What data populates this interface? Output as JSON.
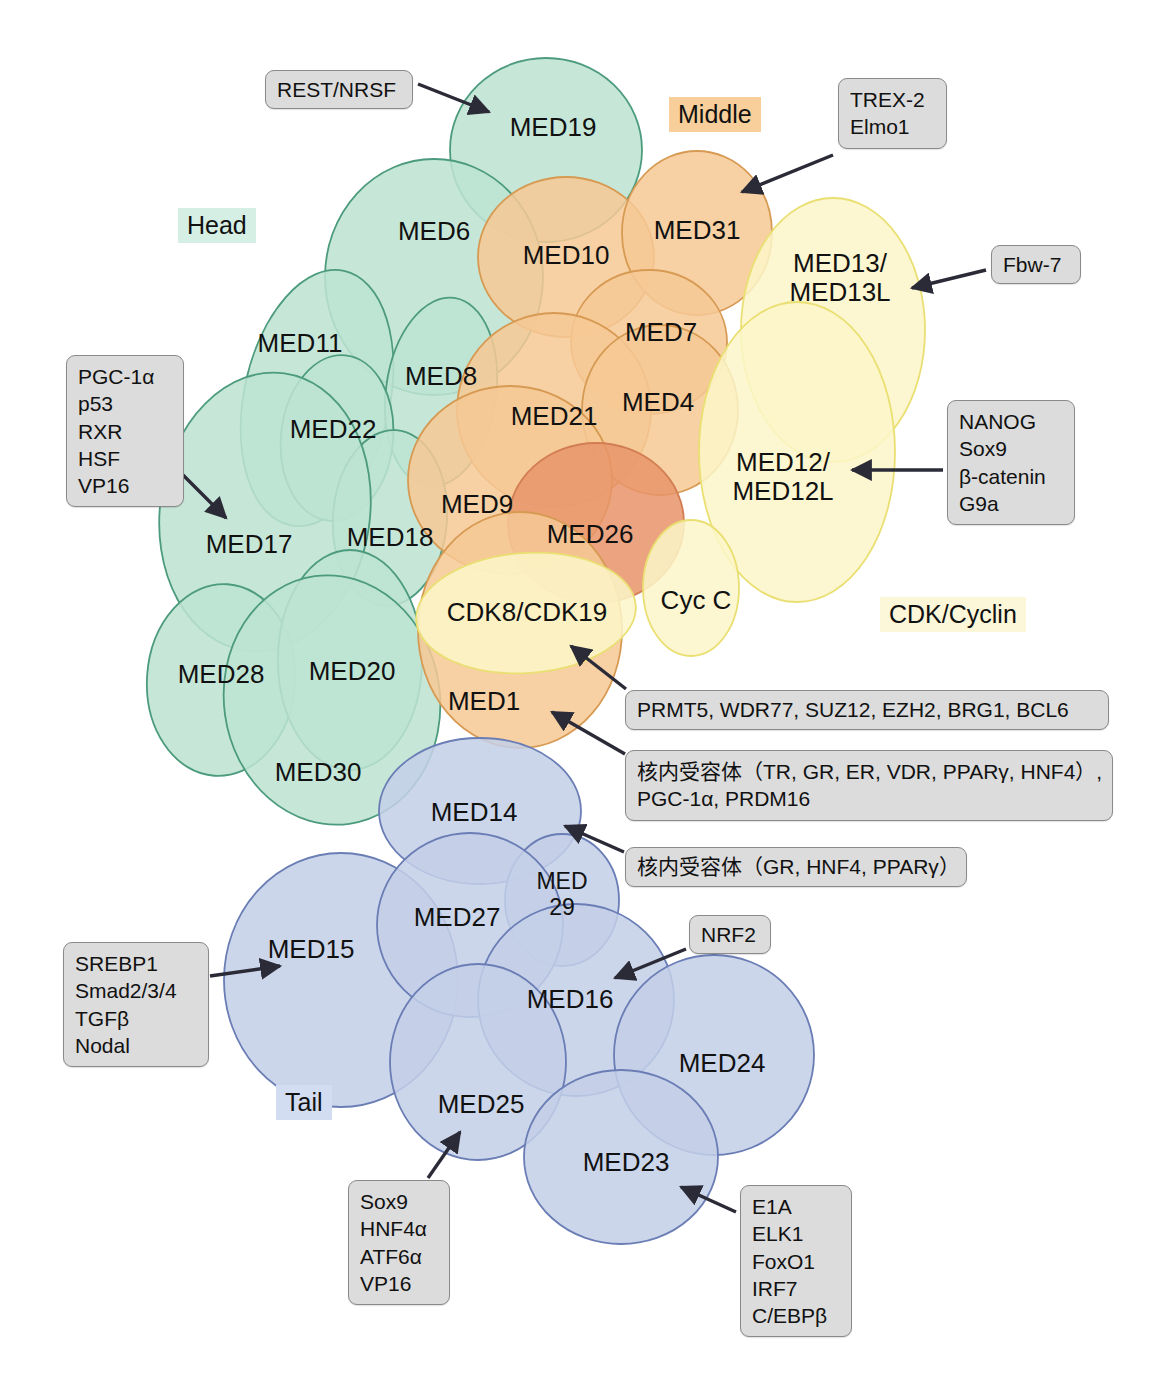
{
  "sections": [
    {
      "name": "head",
      "label": "Head",
      "color": "#d6efe4",
      "x": 178,
      "y": 208
    },
    {
      "name": "middle",
      "label": "Middle",
      "color": "#f8cf9a",
      "x": 669,
      "y": 97
    },
    {
      "name": "cdk",
      "label": "CDK/Cyclin",
      "color": "#fbf7d8",
      "x": 880,
      "y": 597
    },
    {
      "name": "tail",
      "label": "Tail",
      "color": "#d3ddf1",
      "x": 276,
      "y": 1085
    }
  ],
  "modules": {
    "head": {
      "fill": "#bde3d2",
      "stroke": "#4d9b7e"
    },
    "middle": {
      "fill": "#f6c895",
      "stroke": "#d79a53"
    },
    "middle_dark": {
      "fill": "#e8956a",
      "stroke": "#d27d52"
    },
    "cdk": {
      "fill": "#fbf6c8",
      "stroke": "#eadf72"
    },
    "tail": {
      "fill": "#c4cfe8",
      "stroke": "#6a7db5"
    }
  },
  "subunits": [
    {
      "id": "MED19",
      "label": "MED19",
      "module": "head",
      "cx": 546,
      "cy": 150,
      "rx": 96,
      "ry": 92,
      "rot": 0,
      "lx": 553,
      "ly": 128
    },
    {
      "id": "MED6",
      "label": "MED6",
      "module": "head",
      "cx": 434,
      "cy": 277,
      "rx": 109,
      "ry": 118,
      "rot": 0,
      "lx": 434,
      "ly": 232
    },
    {
      "id": "MED11",
      "label": "MED11",
      "module": "head",
      "cx": 317,
      "cy": 398,
      "rx": 73,
      "ry": 130,
      "rot": 12,
      "lx": 300,
      "ly": 344
    },
    {
      "id": "MED8",
      "label": "MED8",
      "module": "head",
      "cx": 441,
      "cy": 392,
      "rx": 55,
      "ry": 95,
      "rot": 8,
      "lx": 441,
      "ly": 377
    },
    {
      "id": "MED22",
      "label": "MED22",
      "module": "head",
      "cx": 337,
      "cy": 438,
      "rx": 56,
      "ry": 83,
      "rot": 6,
      "lx": 333,
      "ly": 430
    },
    {
      "id": "MED18",
      "label": "MED18",
      "module": "head",
      "cx": 390,
      "cy": 518,
      "rx": 57,
      "ry": 88,
      "rot": 4,
      "lx": 390,
      "ly": 538
    },
    {
      "id": "MED17",
      "label": "MED17",
      "module": "head",
      "cx": 265,
      "cy": 512,
      "rx": 105,
      "ry": 140,
      "rot": 8,
      "lx": 249,
      "ly": 545
    },
    {
      "id": "MED28",
      "label": "MED28",
      "module": "head",
      "cx": 221,
      "cy": 680,
      "rx": 74,
      "ry": 96,
      "rot": 4,
      "lx": 221,
      "ly": 675
    },
    {
      "id": "MED20",
      "label": "MED20",
      "module": "head",
      "cx": 350,
      "cy": 660,
      "rx": 72,
      "ry": 110,
      "rot": 0,
      "lx": 352,
      "ly": 672
    },
    {
      "id": "MED30",
      "label": "MED30",
      "module": "head",
      "cx": 332,
      "cy": 700,
      "rx": 108,
      "ry": 125,
      "rot": -8,
      "lx": 318,
      "ly": 773
    },
    {
      "id": "MED10",
      "label": "MED10",
      "module": "middle",
      "cx": 566,
      "cy": 257,
      "rx": 88,
      "ry": 80,
      "rot": 0,
      "lx": 566,
      "ly": 256
    },
    {
      "id": "MED31",
      "label": "MED31",
      "module": "middle",
      "cx": 697,
      "cy": 233,
      "rx": 75,
      "ry": 82,
      "rot": 0,
      "lx": 697,
      "ly": 231
    },
    {
      "id": "MED7",
      "label": "MED7",
      "module": "middle",
      "cx": 649,
      "cy": 342,
      "rx": 78,
      "ry": 72,
      "rot": 0,
      "lx": 661,
      "ly": 333
    },
    {
      "id": "MED21",
      "label": "MED21",
      "module": "middle",
      "cx": 554,
      "cy": 410,
      "rx": 97,
      "ry": 97,
      "rot": 0,
      "lx": 554,
      "ly": 417
    },
    {
      "id": "MED4",
      "label": "MED4",
      "module": "middle",
      "cx": 660,
      "cy": 410,
      "rx": 78,
      "ry": 85,
      "rot": 0,
      "lx": 658,
      "ly": 403
    },
    {
      "id": "MED9",
      "label": "MED9",
      "module": "middle",
      "cx": 510,
      "cy": 480,
      "rx": 102,
      "ry": 94,
      "rot": 0,
      "lx": 477,
      "ly": 505
    },
    {
      "id": "MED26",
      "label": "MED26",
      "module": "middle_dark",
      "cx": 596,
      "cy": 523,
      "rx": 88,
      "ry": 80,
      "rot": 0,
      "lx": 590,
      "ly": 535
    },
    {
      "id": "MED1",
      "label": "MED1",
      "module": "middle",
      "cx": 520,
      "cy": 630,
      "rx": 102,
      "ry": 118,
      "rot": 0,
      "lx": 484,
      "ly": 702
    },
    {
      "id": "MED13",
      "label": "MED13/\nMED13L",
      "module": "cdk",
      "cx": 833,
      "cy": 330,
      "rx": 92,
      "ry": 132,
      "rot": 0,
      "lx": 840,
      "ly": 278
    },
    {
      "id": "MED12",
      "label": "MED12/\nMED12L",
      "module": "cdk",
      "cx": 797,
      "cy": 452,
      "rx": 98,
      "ry": 150,
      "rot": 0,
      "lx": 783,
      "ly": 477
    },
    {
      "id": "CDK8",
      "label": "CDK8/CDK19",
      "module": "cdk",
      "cx": 526,
      "cy": 613,
      "rx": 110,
      "ry": 60,
      "rot": -4,
      "lx": 527,
      "ly": 613
    },
    {
      "id": "CycC",
      "label": "Cyc C",
      "module": "cdk",
      "cx": 691,
      "cy": 588,
      "rx": 48,
      "ry": 68,
      "rot": 0,
      "lx": 696,
      "ly": 601
    },
    {
      "id": "MED14",
      "label": "MED14",
      "module": "tail",
      "cx": 480,
      "cy": 811,
      "rx": 101,
      "ry": 73,
      "rot": 0,
      "lx": 474,
      "ly": 813
    },
    {
      "id": "MED29",
      "label": "MED\n29",
      "module": "tail",
      "cx": 562,
      "cy": 900,
      "rx": 57,
      "ry": 66,
      "rot": 0,
      "lx": 562,
      "ly": 895
    },
    {
      "id": "MED15",
      "label": "MED15",
      "module": "tail",
      "cx": 341,
      "cy": 980,
      "rx": 117,
      "ry": 127,
      "rot": 0,
      "lx": 311,
      "ly": 950
    },
    {
      "id": "MED27",
      "label": "MED27",
      "module": "tail",
      "cx": 470,
      "cy": 925,
      "rx": 93,
      "ry": 92,
      "rot": 0,
      "lx": 457,
      "ly": 918
    },
    {
      "id": "MED16",
      "label": "MED16",
      "module": "tail",
      "cx": 576,
      "cy": 1000,
      "rx": 98,
      "ry": 96,
      "rot": 0,
      "lx": 570,
      "ly": 1000
    },
    {
      "id": "MED24",
      "label": "MED24",
      "module": "tail",
      "cx": 714,
      "cy": 1055,
      "rx": 100,
      "ry": 100,
      "rot": 0,
      "lx": 722,
      "ly": 1064
    },
    {
      "id": "MED25",
      "label": "MED25",
      "module": "tail",
      "cx": 478,
      "cy": 1062,
      "rx": 88,
      "ry": 98,
      "rot": 0,
      "lx": 481,
      "ly": 1105
    },
    {
      "id": "MED23",
      "label": "MED23",
      "module": "tail",
      "cx": 621,
      "cy": 1157,
      "rx": 97,
      "ry": 87,
      "rot": 0,
      "lx": 626,
      "ly": 1163
    }
  ],
  "callouts": [
    {
      "id": "rest",
      "lines": [
        "REST/NRSF"
      ],
      "x": 265,
      "y": 70,
      "w": 148,
      "h": 38
    },
    {
      "id": "trex",
      "lines": [
        "TREX-2",
        "Elmo1"
      ],
      "x": 838,
      "y": 78,
      "w": 109,
      "h": 68
    },
    {
      "id": "fbw7",
      "lines": [
        "Fbw-7"
      ],
      "x": 991,
      "y": 245,
      "w": 90,
      "h": 38
    },
    {
      "id": "pgc",
      "lines": [
        "PGC-1α",
        "p53",
        "RXR",
        "HSF",
        "VP16"
      ],
      "x": 66,
      "y": 355,
      "w": 118,
      "h": 148
    },
    {
      "id": "nanog",
      "lines": [
        "NANOG",
        "Sox9",
        "β-catenin",
        "G9a"
      ],
      "x": 947,
      "y": 400,
      "w": 128,
      "h": 122
    },
    {
      "id": "prmt5",
      "lines": [
        "PRMT5, WDR77, SUZ12, EZH2, BRG1, BCL6"
      ],
      "x": 625,
      "y": 690,
      "w": 484,
      "h": 40
    },
    {
      "id": "nr1",
      "lines": [
        "核内受容体（TR, GR, ER, VDR, PPARγ, HNF4）,",
        "PGC-1α, PRDM16"
      ],
      "x": 625,
      "y": 750,
      "w": 488,
      "h": 68
    },
    {
      "id": "nr2",
      "lines": [
        "核内受容体（GR, HNF4, PPARγ）"
      ],
      "x": 625,
      "y": 847,
      "w": 342,
      "h": 40
    },
    {
      "id": "nrf2",
      "lines": [
        "NRF2"
      ],
      "x": 689,
      "y": 915,
      "w": 82,
      "h": 38
    },
    {
      "id": "srebp",
      "lines": [
        "SREBP1",
        "Smad2/3/4",
        "TGFβ",
        "Nodal"
      ],
      "x": 63,
      "y": 942,
      "w": 146,
      "h": 120
    },
    {
      "id": "sox9",
      "lines": [
        "Sox9",
        "HNF4α",
        "ATF6α",
        "VP16"
      ],
      "x": 348,
      "y": 1180,
      "w": 102,
      "h": 118
    },
    {
      "id": "e1a",
      "lines": [
        "E1A",
        "ELK1",
        "FoxO1",
        "IRF7",
        "C/EBPβ"
      ],
      "x": 740,
      "y": 1185,
      "w": 112,
      "h": 148
    }
  ],
  "arrows": [
    {
      "id": "rest-to-med19",
      "x1": 418,
      "y1": 84,
      "x2": 489,
      "y2": 112,
      "head": true
    },
    {
      "id": "trex-to-med31",
      "x1": 833,
      "y1": 155,
      "x2": 742,
      "y2": 192,
      "head": true
    },
    {
      "id": "fbw7-to-med13",
      "x1": 986,
      "y1": 270,
      "x2": 912,
      "y2": 288,
      "head": true
    },
    {
      "id": "pgc-to-med17",
      "x1": 178,
      "y1": 470,
      "x2": 226,
      "y2": 518,
      "head": true
    },
    {
      "id": "nanog-to-med12",
      "x1": 943,
      "y1": 470,
      "x2": 852,
      "y2": 470,
      "head": true
    },
    {
      "id": "prmt5-to-cdk8",
      "x1": 626,
      "y1": 689,
      "x2": 571,
      "y2": 646,
      "head": true
    },
    {
      "id": "nr1-to-med1",
      "x1": 625,
      "y1": 754,
      "x2": 552,
      "y2": 712,
      "head": true
    },
    {
      "id": "nr2-to-med14",
      "x1": 624,
      "y1": 852,
      "x2": 565,
      "y2": 826,
      "head": true
    },
    {
      "id": "nrf2-to-med16",
      "x1": 686,
      "y1": 949,
      "x2": 615,
      "y2": 978,
      "head": true
    },
    {
      "id": "srebp-to-med15",
      "x1": 210,
      "y1": 976,
      "x2": 280,
      "y2": 966,
      "head": true
    },
    {
      "id": "sox9-to-med25",
      "x1": 428,
      "y1": 1178,
      "x2": 460,
      "y2": 1132,
      "head": true
    },
    {
      "id": "e1a-to-med23",
      "x1": 736,
      "y1": 1212,
      "x2": 681,
      "y2": 1187,
      "head": true
    }
  ]
}
